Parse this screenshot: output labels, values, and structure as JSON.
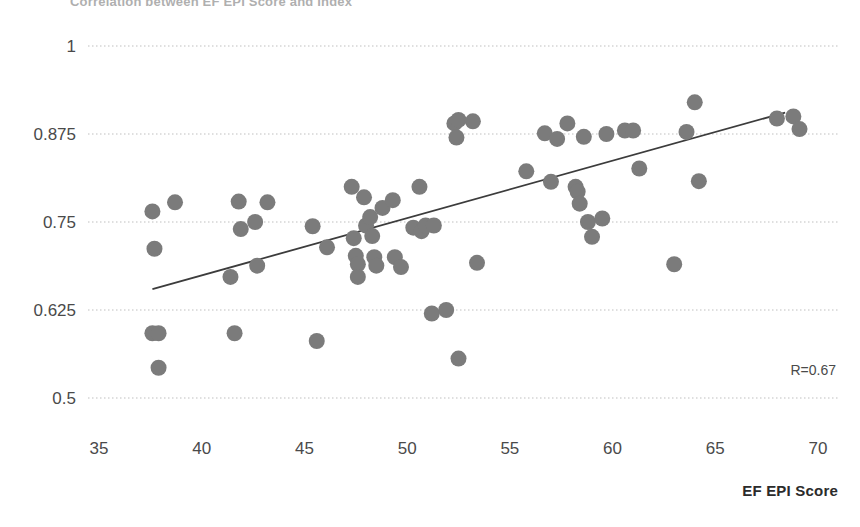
{
  "chart_data": {
    "type": "scatter",
    "title": "Correlation between EF EPI Score and Index",
    "xlabel": "EF EPI Score",
    "ylabel": "",
    "xlim": [
      35,
      70
    ],
    "ylim": [
      0.5,
      1.0
    ],
    "xticks": [
      35,
      40,
      45,
      50,
      55,
      60,
      65,
      70
    ],
    "xtick_labels": [
      "35",
      "40",
      "45",
      "50",
      "55",
      "60",
      "65",
      "70"
    ],
    "yticks": [
      0.5,
      0.625,
      0.75,
      0.875,
      1
    ],
    "ytick_labels": [
      "0.5",
      "0.625",
      "0.75",
      "0.875",
      "1"
    ],
    "grid": "horizontal-dotted",
    "legend": "none",
    "annotation": "R=0.67",
    "point_color": "#7b7b7b",
    "point_radius": 8,
    "trendline": {
      "color": "#3c3c3c",
      "x_start": 37.6,
      "y_start": 0.6545,
      "x_end": 68.4,
      "y_end": 0.9055
    },
    "points": [
      {
        "x": 37.6,
        "y": 0.765
      },
      {
        "x": 37.6,
        "y": 0.592
      },
      {
        "x": 37.7,
        "y": 0.712
      },
      {
        "x": 37.9,
        "y": 0.592
      },
      {
        "x": 37.9,
        "y": 0.543
      },
      {
        "x": 38.7,
        "y": 0.778
      },
      {
        "x": 41.4,
        "y": 0.672
      },
      {
        "x": 41.6,
        "y": 0.592
      },
      {
        "x": 41.8,
        "y": 0.779
      },
      {
        "x": 41.9,
        "y": 0.74
      },
      {
        "x": 42.6,
        "y": 0.75
      },
      {
        "x": 42.7,
        "y": 0.688
      },
      {
        "x": 43.2,
        "y": 0.778
      },
      {
        "x": 45.4,
        "y": 0.744
      },
      {
        "x": 45.6,
        "y": 0.581
      },
      {
        "x": 46.1,
        "y": 0.714
      },
      {
        "x": 47.3,
        "y": 0.8
      },
      {
        "x": 47.4,
        "y": 0.727
      },
      {
        "x": 47.5,
        "y": 0.702
      },
      {
        "x": 47.6,
        "y": 0.69
      },
      {
        "x": 47.6,
        "y": 0.672
      },
      {
        "x": 47.9,
        "y": 0.785
      },
      {
        "x": 48.0,
        "y": 0.745
      },
      {
        "x": 48.2,
        "y": 0.757
      },
      {
        "x": 48.3,
        "y": 0.73
      },
      {
        "x": 48.4,
        "y": 0.7
      },
      {
        "x": 48.5,
        "y": 0.688
      },
      {
        "x": 48.8,
        "y": 0.77
      },
      {
        "x": 49.3,
        "y": 0.781
      },
      {
        "x": 49.4,
        "y": 0.7
      },
      {
        "x": 49.7,
        "y": 0.686
      },
      {
        "x": 50.3,
        "y": 0.742
      },
      {
        "x": 50.6,
        "y": 0.8
      },
      {
        "x": 50.7,
        "y": 0.737
      },
      {
        "x": 50.9,
        "y": 0.745
      },
      {
        "x": 51.2,
        "y": 0.62
      },
      {
        "x": 51.3,
        "y": 0.745
      },
      {
        "x": 51.9,
        "y": 0.625
      },
      {
        "x": 52.3,
        "y": 0.89
      },
      {
        "x": 52.4,
        "y": 0.87
      },
      {
        "x": 52.5,
        "y": 0.895
      },
      {
        "x": 52.5,
        "y": 0.556
      },
      {
        "x": 53.2,
        "y": 0.893
      },
      {
        "x": 53.4,
        "y": 0.692
      },
      {
        "x": 55.8,
        "y": 0.822
      },
      {
        "x": 56.7,
        "y": 0.876
      },
      {
        "x": 57.0,
        "y": 0.807
      },
      {
        "x": 57.3,
        "y": 0.868
      },
      {
        "x": 57.8,
        "y": 0.89
      },
      {
        "x": 58.2,
        "y": 0.8
      },
      {
        "x": 58.3,
        "y": 0.793
      },
      {
        "x": 58.4,
        "y": 0.776
      },
      {
        "x": 58.6,
        "y": 0.871
      },
      {
        "x": 58.8,
        "y": 0.75
      },
      {
        "x": 59.0,
        "y": 0.729
      },
      {
        "x": 59.5,
        "y": 0.755
      },
      {
        "x": 59.7,
        "y": 0.875
      },
      {
        "x": 60.6,
        "y": 0.88
      },
      {
        "x": 61.0,
        "y": 0.88
      },
      {
        "x": 61.3,
        "y": 0.826
      },
      {
        "x": 63.0,
        "y": 0.69
      },
      {
        "x": 63.6,
        "y": 0.878
      },
      {
        "x": 64.0,
        "y": 0.92
      },
      {
        "x": 64.2,
        "y": 0.808
      },
      {
        "x": 68.0,
        "y": 0.897
      },
      {
        "x": 68.8,
        "y": 0.9
      },
      {
        "x": 69.1,
        "y": 0.882
      }
    ]
  },
  "annotations": {
    "correlation": "R=0.67"
  }
}
